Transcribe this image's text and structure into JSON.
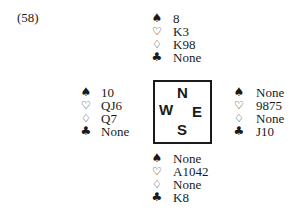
{
  "problem_label": "(58)",
  "suit_symbols": {
    "spades": "♠",
    "hearts": "♡",
    "diamonds": "♢",
    "clubs": "♣"
  },
  "compass": {
    "north": "N",
    "west": "W",
    "east": "E",
    "south": "S"
  },
  "hands": {
    "north": {
      "spades": "8",
      "hearts": "K3",
      "diamonds": "K98",
      "clubs": "None"
    },
    "west": {
      "spades": "10",
      "hearts": "QJ6",
      "diamonds": "Q7",
      "clubs": "None"
    },
    "east": {
      "spades": "None",
      "hearts": "9875",
      "diamonds": "None",
      "clubs": "J10"
    },
    "south": {
      "spades": "None",
      "hearts": "A1042",
      "diamonds": "None",
      "clubs": "K8"
    }
  }
}
